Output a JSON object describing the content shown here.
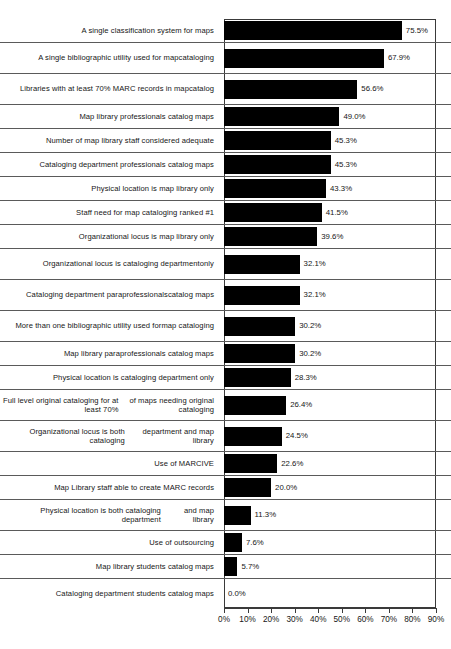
{
  "chart_data": {
    "type": "bar",
    "orientation": "horizontal",
    "title": "",
    "xlabel": "",
    "ylabel": "",
    "xlim": [
      0,
      90
    ],
    "grid": false,
    "legend": null,
    "x_tick_labels": [
      "0%",
      "10%",
      "20%",
      "30%",
      "40%",
      "50%",
      "60%",
      "70%",
      "80%",
      "90%"
    ],
    "x_tick_values": [
      0,
      10,
      20,
      30,
      40,
      50,
      60,
      70,
      80,
      90
    ],
    "bar_color": "#000000",
    "categories": [
      "A single classification system for maps",
      "A single bibliographic utility used for map cataloging",
      "Libraries with at least 70% MARC records in map catalog",
      "Map library professionals catalog maps",
      "Number of map library staff considered adequate",
      "Cataloging department professionals catalog maps",
      "Physical location is map library only",
      "Staff need for map cataloging ranked #1",
      "Organizational locus is map library only",
      "Organizational locus is cataloging department only",
      "Cataloging department paraprofessionals catalog maps",
      "More than one bibliographic utility used for map cataloging",
      "Map library paraprofessionals catalog maps",
      "Physical location is cataloging department only",
      "Full level original cataloging for at least 70% of maps needing original cataloging",
      "Organizational locus is both cataloging department and map library",
      "Use of MARCIVE",
      "Map Library staff able to create MARC records",
      "Physical location is both cataloging department and map library",
      "Use of outsourcing",
      "Map library students catalog maps",
      "Cataloging department students catalog maps"
    ],
    "values": [
      75.5,
      67.9,
      56.6,
      49.0,
      45.3,
      45.3,
      43.3,
      41.5,
      39.6,
      32.1,
      32.1,
      30.2,
      30.2,
      28.3,
      26.4,
      24.5,
      22.6,
      20.0,
      11.3,
      7.6,
      5.7,
      0.0
    ],
    "value_labels": [
      "75.5%",
      "67.9%",
      "56.6%",
      "49.0%",
      "45.3%",
      "45.3%",
      "43.3%",
      "41.5%",
      "39.6%",
      "32.1%",
      "32.1%",
      "30.2%",
      "30.2%",
      "28.3%",
      "26.4%",
      "24.5%",
      "22.6%",
      "20.0%",
      "11.3%",
      "7.6%",
      "5.7%",
      "0.0%"
    ],
    "category_line_breaks": [
      [
        "A single classification system for maps"
      ],
      [
        "A single bibliographic utility used for map",
        "cataloging"
      ],
      [
        "Libraries with at least 70% MARC records in map",
        "catalog"
      ],
      [
        "Map library professionals catalog maps"
      ],
      [
        "Number of map library staff considered adequate"
      ],
      [
        "Cataloging department professionals catalog maps"
      ],
      [
        "Physical location is map library only"
      ],
      [
        "Staff need for map cataloging ranked #1"
      ],
      [
        "Organizational locus is map library only"
      ],
      [
        "Organizational locus is cataloging department",
        "only"
      ],
      [
        "Cataloging department paraprofessionals",
        "catalog maps"
      ],
      [
        "More than one bibliographic utility used for",
        "map cataloging"
      ],
      [
        "Map library paraprofessionals catalog maps"
      ],
      [
        "Physical location is cataloging department only"
      ],
      [
        "Full level original cataloging for at least 70%",
        "of maps needing original cataloging"
      ],
      [
        "Organizational locus is both cataloging",
        "department and map library"
      ],
      [
        "Use of MARCIVE"
      ],
      [
        "Map Library staff able to create MARC records"
      ],
      [
        "Physical location is both cataloging department",
        "and map library"
      ],
      [
        "Use of outsourcing"
      ],
      [
        "Map library students catalog maps"
      ],
      [
        "Cataloging department students catalog maps"
      ]
    ]
  }
}
